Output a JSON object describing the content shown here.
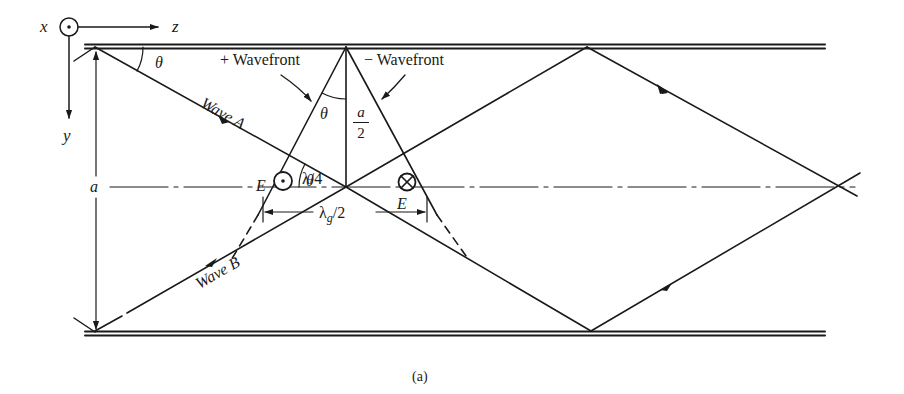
{
  "figure": {
    "caption": "(a)",
    "colors": {
      "ink": "#1a1a1a",
      "background": "#ffffff"
    }
  },
  "axes": {
    "x_label": "x",
    "z_label": "z",
    "y_label": "y"
  },
  "labels": {
    "theta_top_left": "θ",
    "plus_wavefront": "+ Wavefront",
    "minus_wavefront": "− Wavefront",
    "wave_a": "Wave A",
    "wave_b": "Wave B",
    "theta_apex": "θ",
    "theta_center": "θ",
    "a_half_num": "a",
    "a_half_den": "2",
    "lambda_quarter": "λ/4",
    "lambda_g_half_main": "λ",
    "lambda_g_half_sub": "g",
    "lambda_g_half_rest": "/2",
    "e_left": "E",
    "e_right": "E",
    "a_height": "a"
  },
  "symbols": {
    "e_left_symbol": "out-of-page (dot in circle)",
    "e_right_symbol": "into-page (cross in circle)"
  }
}
